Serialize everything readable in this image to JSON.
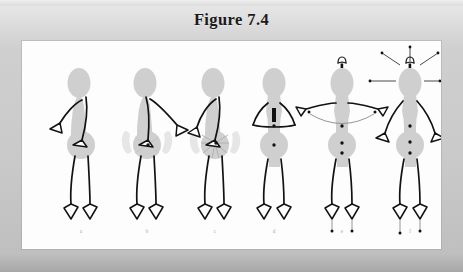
{
  "figure": {
    "title": "Figure 7.4",
    "panel_background": "#fdfdfd",
    "plate_background": "#c9c9c9",
    "body_fill": "#cfcfcf",
    "halo_fill": "#e4e4e4",
    "ink_color": "#111111",
    "label_color": "#a9a9a9",
    "caption_labels": [
      "a",
      "b",
      "c",
      "d",
      "e",
      "f"
    ],
    "panels": [
      {
        "key": "a",
        "label": "a",
        "pose": "three-quarter turn, left arm swinging forward, right arm down along body",
        "markers": [],
        "annotations": []
      },
      {
        "key": "b",
        "label": "b",
        "pose": "three-quarter turn, both arms swung to the right, pelvis highlighted",
        "markers": [
          "pelvis-center-dot"
        ],
        "annotations": [
          "pelvis-bowtie-halo"
        ]
      },
      {
        "key": "c",
        "label": "c",
        "pose": "three-quarter turn, arms forward, pelvis rotation emphasized with radiating shading",
        "markers": [
          "pelvis-center-dot"
        ],
        "annotations": [
          "pelvis-bowtie-halo",
          "pelvis-radiating-lines"
        ]
      },
      {
        "key": "d",
        "label": "d",
        "pose": "frontal stance, arms forming triangle at chest, hands meeting at sternum",
        "markers": [
          "chest-bar",
          "chest-dot",
          "pelvis-dot"
        ],
        "annotations": [
          "vertical-bar-marker"
        ]
      },
      {
        "key": "e",
        "label": "e",
        "pose": "frontal stance, arms extended horizontally sideways",
        "markers": [
          "chest-dot",
          "pelvis-dot",
          "hip-dot",
          "hand-dot-left",
          "hand-dot-right",
          "head-dot"
        ],
        "annotations": [
          "up-arrow-above-head",
          "arm-arc-connector",
          "foot-drop-lines"
        ]
      },
      {
        "key": "f",
        "label": "f",
        "pose": "frontal stance, arms hanging down and out",
        "markers": [
          "chest-dot",
          "pelvis-dot",
          "hip-dot",
          "head-dot"
        ],
        "annotations": [
          "up-arrow-above-head",
          "radiating-head-rays",
          "foot-drop-lines"
        ]
      }
    ]
  }
}
